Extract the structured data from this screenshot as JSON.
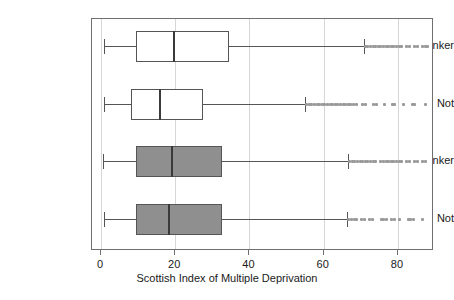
{
  "chart_data": {
    "type": "box",
    "title": "",
    "xlabel": "Scottish Index of Multiple Deprivation",
    "ylabel": "",
    "xlim": [
      -1,
      90
    ],
    "xticks": [
      0,
      20,
      40,
      60,
      80
    ],
    "xticklabels": [
      "0",
      "20",
      "40",
      "60",
      "80"
    ],
    "grid": "vertical-light",
    "orientation": "horizontal",
    "categories": [
      "Heavy drinker",
      "Not",
      "Heavy drinker",
      "Not"
    ],
    "boxes": [
      {
        "label": "Heavy drinker",
        "fill": "white",
        "whisker_low": 0.8,
        "q1": 9.4,
        "median": 19.4,
        "q3": 34.5,
        "whisker_high": 70.9,
        "outliers": [
          71.2,
          71.9,
          72.6,
          73.3,
          74.0,
          74.7,
          75.4,
          76.1,
          76.8,
          77.5,
          78.2,
          78.9,
          79.6,
          80.3,
          81.0,
          82.4,
          83.1,
          84.5,
          85.2,
          86.6,
          87.3,
          88.0
        ]
      },
      {
        "label": "Not",
        "fill": "white",
        "whisker_low": 0.8,
        "q1": 8.1,
        "median": 15.6,
        "q3": 27.5,
        "whisker_high": 55.0,
        "outliers": [
          55.4,
          56.1,
          56.8,
          57.5,
          58.2,
          58.9,
          59.6,
          60.3,
          61.0,
          61.7,
          62.4,
          63.1,
          63.8,
          64.5,
          65.2,
          65.9,
          66.6,
          67.3,
          68.0,
          68.7,
          70.5,
          71.2,
          73.5,
          74.2,
          76.5,
          78.4,
          79.1,
          81.5,
          83.8,
          84.5,
          87.5
        ]
      },
      {
        "label": "Heavy drinker",
        "fill": "grey",
        "whisker_low": 0.6,
        "q1": 9.4,
        "median": 18.9,
        "q3": 32.6,
        "whisker_high": 66.6,
        "outliers": [
          67.0,
          67.7,
          68.4,
          69.1,
          69.8,
          70.5,
          71.2,
          71.9,
          72.6,
          73.3,
          74.0,
          75.4,
          76.1,
          76.8,
          77.5,
          78.2,
          78.9,
          79.6,
          80.3,
          81.0,
          82.4,
          83.1,
          84.5,
          85.2,
          86.6,
          87.3
        ]
      },
      {
        "label": "Not",
        "fill": "grey",
        "whisker_low": 0.9,
        "q1": 9.4,
        "median": 18.1,
        "q3": 32.6,
        "whisker_high": 66.3,
        "outliers": [
          66.8,
          67.5,
          68.2,
          68.9,
          70.3,
          71.0,
          72.4,
          73.1,
          75.5,
          76.2,
          76.9,
          78.3,
          79.0,
          80.4,
          82.8,
          83.5,
          84.2,
          86.6
        ]
      }
    ]
  },
  "axis": {
    "x_title": "Scottish Index of Multiple Deprivation",
    "ticks": [
      {
        "value": "0"
      },
      {
        "value": "20"
      },
      {
        "value": "40"
      },
      {
        "value": "60"
      },
      {
        "value": "80"
      }
    ]
  },
  "categories": [
    {
      "label": "Heavy drinker"
    },
    {
      "label": "Not"
    },
    {
      "label": "Heavy drinker"
    },
    {
      "label": "Not"
    }
  ]
}
